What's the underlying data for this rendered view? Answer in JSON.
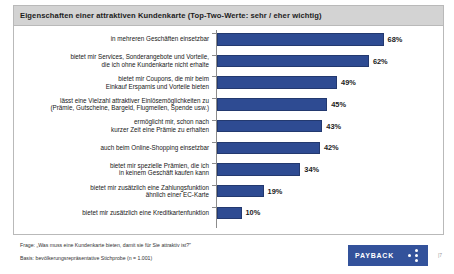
{
  "panel": {
    "title": "Eigenschaften einer attraktiven Kundenkarte (Top-Two-Werte: sehr / eher wichtig)"
  },
  "footer": {
    "question": "Frage: „Was muss eine Kundenkarte bieten, damit sie für Sie attraktiv ist?\"",
    "base": "Basis: bevölkerungsrepräsentative Stichprobe (n = 1.001)",
    "logo_text": "PAYBACK",
    "corner_mark": "|7"
  },
  "colors": {
    "bar": "#2e4b92",
    "bar_border": "#23396f",
    "title_band": "#d3d3d3",
    "panel_border": "#b9b9b9",
    "axis": "#8c8c8c",
    "logo": "#33529b"
  },
  "chart_data": {
    "type": "bar",
    "orientation": "horizontal",
    "title": "Eigenschaften einer attraktiven Kundenkarte (Top-Two-Werte: sehr / eher wichtig)",
    "xlabel": "",
    "ylabel": "",
    "xlim": [
      0,
      75
    ],
    "grid": false,
    "legend": null,
    "value_suffix": "%",
    "categories": [
      "in mehreren Geschäften einsetzbar",
      "bietet mir Services, Sonderangebote und Vorteile,\ndie ich ohne Kundenkarte nicht erhalte",
      "bietet mir Coupons, die mir beim\nEinkauf Ersparnis und Vorteile bieten",
      "lässt eine Vielzahl attraktiver Einlösemöglichkeiten zu\n(Prämie, Gutscheine, Bargeld, Flugmeilen, Spende usw.)",
      "ermöglicht mir, schon nach\nkurzer Zeit eine Prämie zu erhalten",
      "auch beim Online-Shopping einsetzbar",
      "bietet mir spezielle Prämien, die ich\nin keinem Geschäft kaufen kann",
      "bietet mir zusätzlich eine Zahlungsfunktion\nähnlich einer EC-Karte",
      "bietet mir zusätzlich eine Kreditkartenfunktion"
    ],
    "values": [
      68,
      62,
      49,
      45,
      43,
      42,
      34,
      19,
      10
    ],
    "value_labels": [
      "68%",
      "62%",
      "49%",
      "45%",
      "43%",
      "42%",
      "34%",
      "19%",
      "10%"
    ]
  }
}
